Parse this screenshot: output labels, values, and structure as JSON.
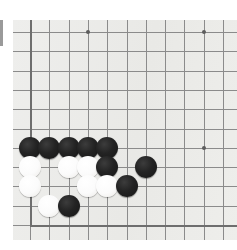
{
  "diagram": {
    "kind": "go-board-diagram",
    "board_color": "#ececea",
    "line_color": "#8b8b8b",
    "edge_line_color": "#6e6e6e",
    "black_color": "#1d1d1d",
    "white_color": "#fbfbfb",
    "grid_spacing": 19.3,
    "origin": {
      "x": 17,
      "y": 12
    },
    "columns": 11,
    "rows": 11,
    "board_rect": {
      "left": 13,
      "top": 20,
      "width": 224,
      "height": 220
    },
    "star_points": [
      {
        "col": 3,
        "row": 0
      },
      {
        "col": 9,
        "row": 0
      },
      {
        "col": 9,
        "row": 6
      }
    ],
    "board_edges": {
      "left_col": 0,
      "bottom_row": 10
    },
    "stones": [
      {
        "color": "black",
        "col": 0,
        "row": 6
      },
      {
        "color": "black",
        "col": 1,
        "row": 6
      },
      {
        "color": "black",
        "col": 2,
        "row": 6
      },
      {
        "color": "black",
        "col": 3,
        "row": 6
      },
      {
        "color": "black",
        "col": 4,
        "row": 6
      },
      {
        "color": "white",
        "col": 0,
        "row": 7
      },
      {
        "color": "white",
        "col": 2,
        "row": 7
      },
      {
        "color": "white",
        "col": 3,
        "row": 7
      },
      {
        "color": "black",
        "col": 4,
        "row": 7
      },
      {
        "color": "black",
        "col": 6,
        "row": 7
      },
      {
        "color": "white",
        "col": 0,
        "row": 8
      },
      {
        "color": "white",
        "col": 3,
        "row": 8
      },
      {
        "color": "white",
        "col": 4,
        "row": 8
      },
      {
        "color": "black",
        "col": 5,
        "row": 8
      },
      {
        "color": "white",
        "col": 1,
        "row": 9
      },
      {
        "color": "black",
        "col": 2,
        "row": 9
      }
    ]
  },
  "chrome": {
    "edge_bar_label": "left-edge-bar",
    "edge_bar_color": "#9a9a9a"
  }
}
